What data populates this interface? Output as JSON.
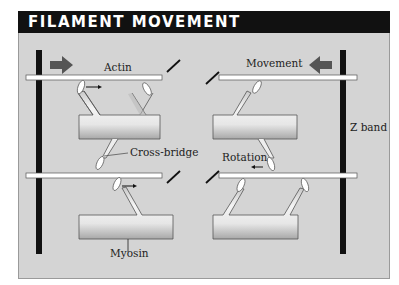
{
  "title": "FILAMENT MOVEMENT",
  "labels": {
    "actin": "Actin",
    "movement": "Movement",
    "z_band": "Z band",
    "cross_bridge": "Cross-bridge",
    "rotation": "Rotation",
    "myosin": "Myosin"
  },
  "colors": {
    "title_bg": "#111111",
    "panel_bg": "#d4d4d4",
    "z_band": "#111111",
    "arrow": "#555555"
  }
}
